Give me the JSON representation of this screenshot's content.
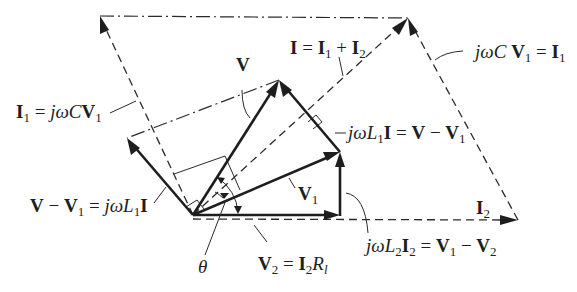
{
  "diagram": {
    "type": "phasor-diagram",
    "origin": [
      193,
      215
    ],
    "vectors": {
      "V": {
        "from": [
          193,
          215
        ],
        "to": [
          279,
          80
        ],
        "style": "solid"
      },
      "V1": {
        "from": [
          193,
          215
        ],
        "to": [
          340,
          152
        ],
        "style": "solid"
      },
      "V2": {
        "from": [
          193,
          215
        ],
        "to": [
          340,
          216
        ],
        "style": "solid"
      },
      "V_minus_V1_left": {
        "from": [
          193,
          215
        ],
        "to": [
          127,
          138
        ],
        "style": "solid"
      },
      "jwL1I_right": {
        "from": [
          340,
          152
        ],
        "to": [
          279,
          80
        ],
        "style": "solid"
      },
      "jwL2I2": {
        "from": [
          340,
          216
        ],
        "to": [
          340,
          152
        ],
        "style": "solid"
      },
      "I": {
        "from": [
          193,
          215
        ],
        "to": [
          408,
          18
        ],
        "style": "dashed"
      },
      "I2": {
        "from": [
          193,
          219
        ],
        "to": [
          518,
          220
        ],
        "style": "dashed"
      },
      "I1_left": {
        "from": [
          193,
          215
        ],
        "to": [
          100,
          16
        ],
        "style": "dashed"
      },
      "I1_right": {
        "from": [
          518,
          220
        ],
        "to": [
          408,
          18
        ],
        "style": "dashed"
      }
    },
    "construction_lines": {
      "top_edge": {
        "from": [
          100,
          16
        ],
        "to": [
          408,
          18
        ],
        "style": "dash-dot"
      },
      "V_to_left": {
        "from": [
          279,
          80
        ],
        "to": [
          127,
          138
        ],
        "style": "dash-dot"
      }
    }
  },
  "labels": {
    "I1_eq_left": {
      "lhs": "I",
      "lhs_sub": "1",
      "eq": " = ",
      "rhs_it": "jωC",
      "rhs_b": "V",
      "rhs_sub": "1"
    },
    "V": "V",
    "I_sum": {
      "lhs": "I",
      "eq": " = ",
      "a": "I",
      "a_sub": "1",
      "plus": " + ",
      "b": "I",
      "b_sub": "2"
    },
    "jwCV1_eq_right": {
      "it": "jωC ",
      "b": "V",
      "sub": "1",
      "eq": " = ",
      "rhs": "I",
      "rhs_sub": "1"
    },
    "jwL1I_eq": {
      "it": "jωL",
      "it_sub": "1",
      "b": "I",
      "eq": " = ",
      "v": "V",
      "minus": " − ",
      "v1": "V",
      "v1_sub": "1"
    },
    "V_minus_V1_eq": {
      "v": "V",
      "minus": " − ",
      "v1": "V",
      "v1_sub": "1",
      "eq": " = ",
      "it": "jωL",
      "it_sub": "1",
      "b": "I"
    },
    "V1": {
      "b": "V",
      "sub": "1"
    },
    "I2": {
      "b": "I",
      "sub": "2"
    },
    "theta": "θ",
    "V2_eq": {
      "b": "V",
      "sub": "2",
      "eq": " = ",
      "i": "I",
      "i_sub": "2",
      "r": "R",
      "r_sub": "l"
    },
    "jwL2I2_eq": {
      "it": "jωL",
      "it_sub": "2",
      "b": "I",
      "b_sub": "2",
      "eq": " = ",
      "v1": "V",
      "v1_sub": "1",
      "minus": " − ",
      "v2": "V",
      "v2_sub": "2"
    }
  }
}
